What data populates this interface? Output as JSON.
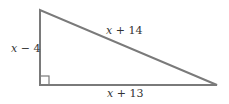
{
  "diagram": {
    "type": "right-triangle",
    "colors": {
      "stroke": "#7a7a7a",
      "label": "#333333",
      "background": "#ffffff"
    },
    "vertices": {
      "top": [
        40,
        10
      ],
      "right_angle": [
        40,
        85
      ],
      "right": [
        217,
        85
      ]
    },
    "right_angle_marker": true,
    "sides": {
      "vertical_leg": {
        "var": "x",
        "rest": " − 4",
        "label": "x − 4"
      },
      "hypotenuse": {
        "var": "x",
        "rest": " + 14",
        "label": "x + 14"
      },
      "horizontal_leg": {
        "var": "x",
        "rest": " + 13",
        "label": "x + 13"
      }
    }
  }
}
